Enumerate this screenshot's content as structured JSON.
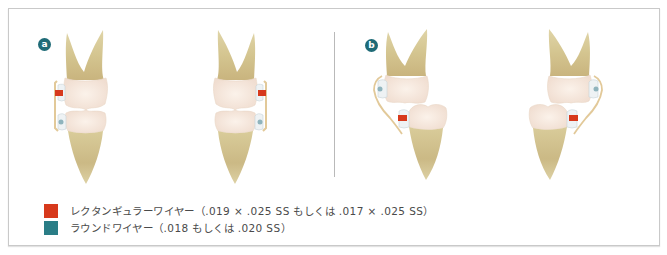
{
  "figure": {
    "panels": [
      {
        "label": "a",
        "description": "Two molar pairs in occlusion; rectangular wire bracket on upper tooth, round wire bracket on lower tooth"
      },
      {
        "label": "b",
        "description": "Two molar pairs with tilted lower tooth; round wire bracket on upper tooth, rectangular wire bracket on lower tooth"
      }
    ],
    "colors": {
      "rectangular_wire": "#d7391c",
      "round_wire": "#2a7d86",
      "badge": "#1f6b77",
      "frame_border": "#c9c9c9"
    },
    "legend": [
      {
        "swatch_color": "#d7391c",
        "label": "レクタンギュラーワイヤー（.019 × .025 SS もしくは .017 × .025 SS）"
      },
      {
        "swatch_color": "#2a7d86",
        "label": "ラウンドワイヤー（.018 もしくは .020 SS）"
      }
    ]
  }
}
